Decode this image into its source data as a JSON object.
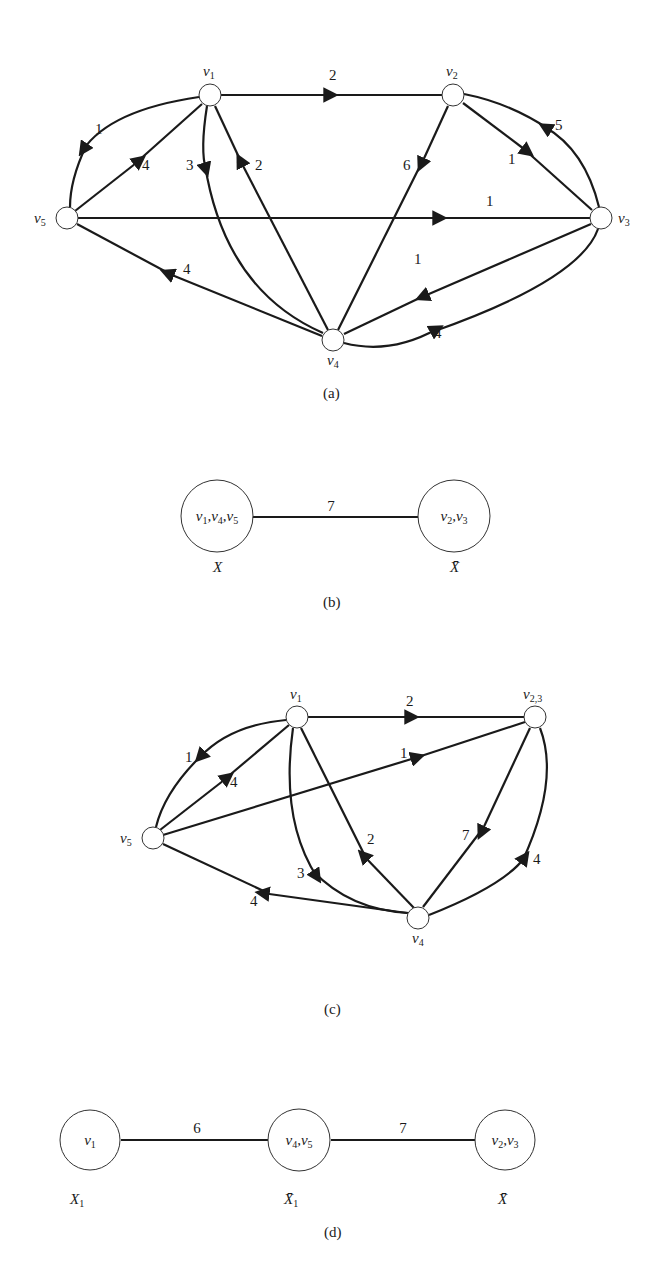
{
  "figure": {
    "panels": [
      {
        "caption": "(a)",
        "type": "directed-weighted-graph",
        "vertices": [
          "v1",
          "v2",
          "v3",
          "v4",
          "v5"
        ],
        "vertex_labels": {
          "v1": "v",
          "v2": "v",
          "v3": "v",
          "v4": "v",
          "v5": "v"
        },
        "vertex_subs": {
          "v1": "1",
          "v2": "2",
          "v3": "3",
          "v4": "4",
          "v5": "5"
        },
        "edges": [
          {
            "from": "v1",
            "to": "v2",
            "weight": "2"
          },
          {
            "from": "v1",
            "to": "v5",
            "weight": "1"
          },
          {
            "from": "v5",
            "to": "v1",
            "weight": "4"
          },
          {
            "from": "v1",
            "to": "v4",
            "weight": "3"
          },
          {
            "from": "v4",
            "to": "v1",
            "weight": "2"
          },
          {
            "from": "v2",
            "to": "v4",
            "weight": "6"
          },
          {
            "from": "v2",
            "to": "v3",
            "weight": "1"
          },
          {
            "from": "v3",
            "to": "v2",
            "weight": "5"
          },
          {
            "from": "v5",
            "to": "v3",
            "weight": "1"
          },
          {
            "from": "v3",
            "to": "v4",
            "weight": "1"
          },
          {
            "from": "v4",
            "to": "v5",
            "weight": "4"
          },
          {
            "from": "v4",
            "to": "v3",
            "weight": "4"
          }
        ]
      },
      {
        "caption": "(b)",
        "type": "cut-tree",
        "nodes": [
          {
            "label": "v1,v4,v5",
            "set": "X"
          },
          {
            "label": "v2,v3",
            "set": "X̄"
          }
        ],
        "edge_weight": "7"
      },
      {
        "caption": "(c)",
        "type": "directed-weighted-graph",
        "vertices": [
          "v1",
          "v2,3",
          "v4",
          "v5"
        ],
        "edges": [
          {
            "from": "v1",
            "to": "v2,3",
            "weight": "2"
          },
          {
            "from": "v1",
            "to": "v5",
            "weight": "1"
          },
          {
            "from": "v5",
            "to": "v1",
            "weight": "4"
          },
          {
            "from": "v5",
            "to": "v2,3",
            "weight": "1"
          },
          {
            "from": "v1",
            "to": "v4",
            "weight": "3"
          },
          {
            "from": "v4",
            "to": "v1",
            "weight": "2"
          },
          {
            "from": "v2,3",
            "to": "v4",
            "weight": "7"
          },
          {
            "from": "v4",
            "to": "v2,3",
            "weight": "4"
          },
          {
            "from": "v4",
            "to": "v5",
            "weight": "4"
          }
        ]
      },
      {
        "caption": "(d)",
        "type": "cut-tree",
        "nodes": [
          {
            "label": "v1",
            "set": "X1"
          },
          {
            "label": "v4,v5",
            "set": "X̄1"
          },
          {
            "label": "v2,v3",
            "set": "X̄"
          }
        ],
        "edge_weights": [
          "6",
          "7"
        ]
      }
    ]
  },
  "labels": {
    "a": {
      "caption": "(a)",
      "w12": "2",
      "w15": "1",
      "w51": "4",
      "w14": "3",
      "w41": "2",
      "w24": "6",
      "w23": "1",
      "w32": "5",
      "w53": "1",
      "w34": "1",
      "w45": "4",
      "w43": "4"
    },
    "b": {
      "caption": "(b)",
      "node_left": "v1,v4,v5",
      "node_right": "v2,v3",
      "set_left": "X",
      "set_right": "X̄",
      "weight": "7"
    },
    "c": {
      "caption": "(c)",
      "w1_23": "2",
      "w15": "1",
      "w51": "4",
      "w5_23": "1",
      "w14": "3",
      "w41": "2",
      "w23_4": "7",
      "w4_23": "4",
      "w45": "4"
    },
    "d": {
      "caption": "(d)",
      "node1": "v1",
      "node2": "v4,v5",
      "node3": "v2,v3",
      "set1": "X1",
      "set2": "X̄1",
      "set3": "X̄",
      "weight12": "6",
      "weight23": "7"
    }
  }
}
